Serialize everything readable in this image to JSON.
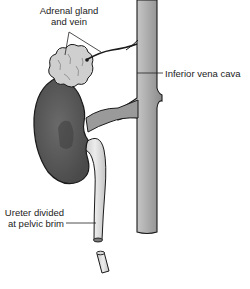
{
  "figure": {
    "labels": {
      "adrenal": "Adrenal gland and vein",
      "adrenal_line1": "Adrenal gland",
      "adrenal_line2": "and vein",
      "ivc": "Inferior vena cava",
      "ureter": "Ureter divided at pelvic brim",
      "ureter_line1": "Ureter divided",
      "ureter_line2": "at pelvic brim"
    },
    "structures": [
      "kidney",
      "adrenal-gland",
      "adrenal-vein",
      "renal-vein",
      "inferior-vena-cava",
      "ureter",
      "ureter-stump"
    ],
    "colors": {
      "kidney": "#5a5a5a",
      "kidney_dark": "#3e3e3e",
      "adrenal": "#cfcfcf",
      "ivc": "#a8a8a8",
      "ureter": "#dedede",
      "outline": "#1a1a1a",
      "text": "#222222"
    }
  }
}
